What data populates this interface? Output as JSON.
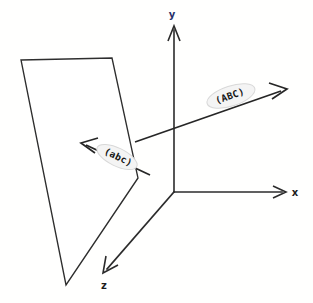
{
  "figure": {
    "background_color": "#fffffe",
    "line_color": "#2b2b2b",
    "width": 313,
    "height": 303
  },
  "axes": {
    "origin": {
      "x": 174,
      "y": 192
    },
    "items": [
      {
        "id": "y-axis",
        "label": "y",
        "label_color": "#26306b",
        "label_x": 172,
        "label_y": 17,
        "from": {
          "x": 174,
          "y": 192
        },
        "to": {
          "x": 174,
          "y": 26
        }
      },
      {
        "id": "x-axis",
        "label": "x",
        "label_color": "#1c1c1c",
        "label_x": 296,
        "label_y": 196,
        "from": {
          "x": 174,
          "y": 192
        },
        "to": {
          "x": 285,
          "y": 192
        }
      },
      {
        "id": "z-axis",
        "label": "z",
        "label_color": "#1c1c1c",
        "label_x": 104,
        "label_y": 288,
        "from": {
          "x": 174,
          "y": 192
        },
        "to": {
          "x": 104,
          "y": 272
        }
      }
    ]
  },
  "plane": {
    "id": "crystal-plane",
    "fill": "#ffffff",
    "stroke": "#2e2e2e",
    "vertices": [
      {
        "x": 21,
        "y": 60
      },
      {
        "x": 112,
        "y": 58
      },
      {
        "x": 138,
        "y": 178
      },
      {
        "x": 66,
        "y": 285
      }
    ]
  },
  "vectors": [
    {
      "id": "vector-abc-upper",
      "label": "(ABC)",
      "from": {
        "x": 135,
        "y": 142
      },
      "to": {
        "x": 285,
        "y": 90
      },
      "label_x": 231,
      "label_y": 103,
      "label_rotation": -19,
      "highlight": {
        "cx": 231,
        "cy": 96,
        "rx": 25,
        "ry": 10,
        "rotation": -18
      }
    },
    {
      "id": "vector-abc-lower",
      "label": "(abc)",
      "from": {
        "x": 150,
        "y": 175
      },
      "to": {
        "x": 82,
        "y": 143
      },
      "label_x": 117,
      "label_y": 162,
      "label_rotation": 26,
      "highlight": {
        "cx": 117,
        "cy": 157,
        "rx": 22,
        "ry": 9,
        "rotation": 26
      }
    }
  ]
}
